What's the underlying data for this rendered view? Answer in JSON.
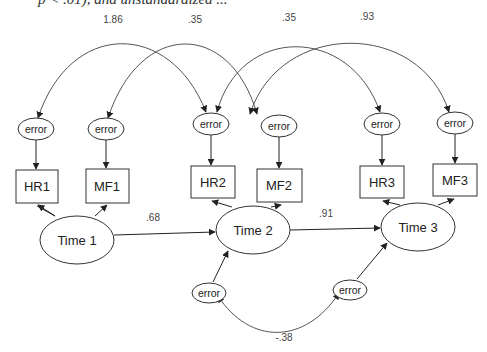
{
  "caption_fragment": "p < .01), and unstandardized ...",
  "diagram": {
    "type": "structural-equation-model",
    "latent_factors": [
      {
        "id": "t1",
        "label": "Time 1"
      },
      {
        "id": "t2",
        "label": "Time 2"
      },
      {
        "id": "t3",
        "label": "Time 3"
      }
    ],
    "indicators": [
      {
        "id": "hr1",
        "label": "HR1",
        "factor": "t1"
      },
      {
        "id": "mf1",
        "label": "MF1",
        "factor": "t1"
      },
      {
        "id": "hr2",
        "label": "HR2",
        "factor": "t2"
      },
      {
        "id": "mf2",
        "label": "MF2",
        "factor": "t2"
      },
      {
        "id": "hr3",
        "label": "HR3",
        "factor": "t3"
      },
      {
        "id": "mf3",
        "label": "MF3",
        "factor": "t3"
      }
    ],
    "error_label": "error",
    "indicator_errors": [
      "error",
      "error",
      "error",
      "error",
      "error",
      "error"
    ],
    "disturbance_errors": [
      "error",
      "error"
    ],
    "paths": [
      {
        "from": "Time 1",
        "to": "Time 2",
        "coef": ".68"
      },
      {
        "from": "Time 2",
        "to": "Time 3",
        "coef": ".91"
      }
    ],
    "error_covariances": [
      {
        "between": [
          "HR1 error",
          "HR2 error"
        ],
        "coef": "1.86"
      },
      {
        "between": [
          "MF1 error",
          "MF2 error"
        ],
        "coef": ".35"
      },
      {
        "between": [
          "HR2 error",
          "HR3 error"
        ],
        "coef": ".35"
      },
      {
        "between": [
          "MF2 error",
          "MF3 error"
        ],
        "coef": ".93"
      },
      {
        "between": [
          "Time 2 disturbance",
          "Time 3 disturbance"
        ],
        "coef": "-.38"
      }
    ]
  }
}
